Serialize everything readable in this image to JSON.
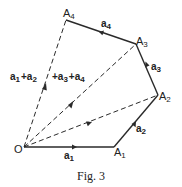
{
  "figure": {
    "caption": "Fig. 3",
    "origin_label": "O",
    "points": [
      {
        "name": "A",
        "sub": "1"
      },
      {
        "name": "A",
        "sub": "2"
      },
      {
        "name": "A",
        "sub": "3"
      },
      {
        "name": "A",
        "sub": "4"
      }
    ],
    "vectors": [
      {
        "name": "a",
        "sub": "1"
      },
      {
        "name": "a",
        "sub": "2"
      },
      {
        "name": "a",
        "sub": "3"
      },
      {
        "name": "a",
        "sub": "4"
      }
    ],
    "sum_label": {
      "parts": [
        {
          "name": "a",
          "sub": "1",
          "op": ""
        },
        {
          "name": "a",
          "sub": "2",
          "op": "+"
        },
        {
          "name": "a",
          "sub": "3",
          "op": "+"
        },
        {
          "name": "a",
          "sub": "4",
          "op": "+"
        }
      ]
    },
    "colors": {
      "line": "#2a2a2a",
      "background": "#ffffff"
    }
  }
}
